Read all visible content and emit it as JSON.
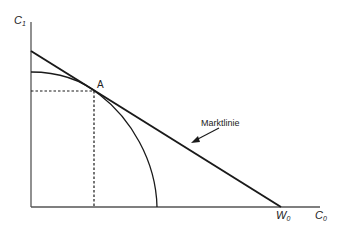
{
  "diagram": {
    "type": "economics-two-period-consumption",
    "labels": {
      "y_axis": "C",
      "y_axis_sub": "1",
      "x_axis": "C",
      "x_axis_sub": "0",
      "x_intercept": "W",
      "x_intercept_sub": "0",
      "point": "A",
      "market_line": "Marktlinie"
    },
    "elements": [
      {
        "name": "y-axis",
        "description": "vertical axis C1"
      },
      {
        "name": "x-axis",
        "description": "horizontal axis C0"
      },
      {
        "name": "market-line",
        "description": "straight line tangent at A, intersecting x-axis at W0"
      },
      {
        "name": "transformation-curve",
        "description": "concave investment opportunity curve"
      },
      {
        "name": "point-A",
        "description": "tangency point with dashed projections to both axes"
      }
    ],
    "colors": {
      "line": "#1a1a1a",
      "axis": "#555555",
      "text": "#222222"
    }
  }
}
